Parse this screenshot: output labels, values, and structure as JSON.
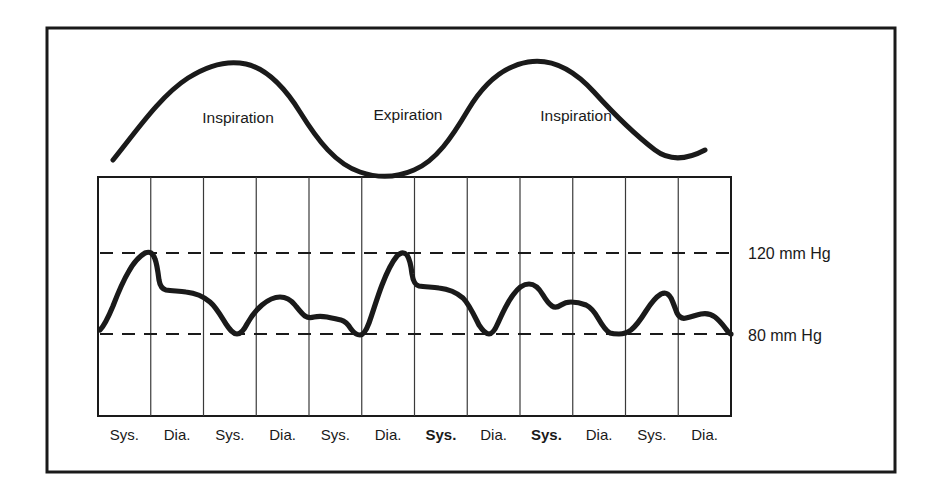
{
  "figure": {
    "name": "pulsus-paradoxus-diagram",
    "background_color": "#ffffff",
    "ink_color": "#1a1a1a",
    "frame": {
      "x": 47,
      "y": 28,
      "width": 848,
      "height": 444,
      "stroke_width": 3
    }
  },
  "respiration": {
    "curve_name": "respiration-trace",
    "labels": [
      {
        "text": "Inspiration",
        "x": 238,
        "y": 123
      },
      {
        "text": "Expiration",
        "x": 408,
        "y": 120
      },
      {
        "text": "Inspiration",
        "x": 576,
        "y": 121
      }
    ],
    "path": "M 113 160 C 135 133, 160 96, 188 78 C 210 64, 228 60, 246 64 C 268 69, 285 88, 300 112 C 318 141, 336 164, 360 172 C 380 179, 398 177, 414 170 C 436 161, 452 137, 468 110 C 484 83, 504 66, 528 62 C 552 58, 574 70, 594 92 C 614 114, 634 134, 655 150 C 672 163, 690 158, 705 150",
    "stroke_width": 5
  },
  "plot": {
    "name": "blood-pressure-trace",
    "grid": {
      "x": 98,
      "y": 177,
      "width": 633,
      "height": 239,
      "columns": 12,
      "border_stroke": 2,
      "line_stroke": 1.2,
      "line_color": "#3a3a3a"
    },
    "reference_lines": [
      {
        "label": "120 mm Hg",
        "y": 253,
        "label_x": 748,
        "label_y": 259
      },
      {
        "label": "80 mm Hg",
        "y": 334,
        "label_x": 748,
        "label_y": 341
      }
    ],
    "waveform_path": "M 100 330 C 104 326, 108 318, 113 306 C 118 293, 123 281, 129 271 C 134 262, 140 256, 145 253 C 150 251, 153 253, 155 259 C 157 264, 158 272, 159 280 C 160 286, 162 289, 166 290 C 172 291, 179 291, 186 292 C 195 293, 203 296, 210 302 C 216 307, 221 316, 226 324 C 230 330, 233 334, 237 334 C 241 334, 244 330, 247 324 C 251 317, 256 310, 262 305 C 268 300, 274 297, 280 297 C 286 297, 291 300, 295 305 C 299 310, 302 314, 305 316 C 308 318, 311 318, 314 317 C 318 316, 322 316, 327 317 C 332 318, 337 319, 341 320 C 345 321, 348 324, 351 329 C 354 333, 357 335, 360 335 C 363 335, 366 331, 369 323 C 373 312, 377 298, 382 285 C 387 272, 392 262, 397 256 C 401 252, 404 252, 407 255 C 409 258, 411 265, 412 274 C 413 281, 415 285, 419 286 C 425 287, 432 287, 439 288 C 448 289, 456 292, 463 298 C 469 304, 474 315, 479 325 C 483 331, 486 334, 489 334 C 492 334, 495 330, 498 323 C 502 314, 507 303, 513 295 C 518 288, 524 284, 529 284 C 534 284, 539 288, 543 295 C 546 300, 549 304, 552 306 C 555 308, 558 307, 561 305 C 564 303, 567 302, 571 302 C 576 302, 581 303, 586 305 C 590 307, 594 311, 598 318 C 602 325, 606 331, 610 333 C 613 334, 616 334, 619 334 C 623 334, 627 333, 631 330 C 636 326, 641 319, 646 311 C 651 303, 656 297, 661 294 C 665 292, 668 293, 671 298 C 673 302, 675 308, 677 313 C 679 317, 682 319, 686 318 C 691 317, 696 315, 701 314 C 706 313, 711 314, 715 317 C 719 320, 723 325, 726 329 C 728 332, 730 334, 731 334",
    "waveform_stroke": 5.2,
    "beat_labels": [
      {
        "text": "Sys.",
        "bold": false
      },
      {
        "text": "Dia.",
        "bold": false
      },
      {
        "text": "Sys.",
        "bold": false
      },
      {
        "text": "Dia.",
        "bold": false
      },
      {
        "text": "Sys.",
        "bold": false
      },
      {
        "text": "Dia.",
        "bold": false
      },
      {
        "text": "Sys.",
        "bold": true
      },
      {
        "text": "Dia.",
        "bold": false
      },
      {
        "text": "Sys.",
        "bold": true
      },
      {
        "text": "Dia.",
        "bold": false
      },
      {
        "text": "Sys.",
        "bold": false
      },
      {
        "text": "Dia.",
        "bold": false
      }
    ],
    "beat_label_y": 440
  },
  "chart_data": {
    "type": "line",
    "title": "",
    "subtitle": "",
    "xlabel": "",
    "ylabel": "",
    "ylim": [
      60,
      140
    ],
    "grid": true,
    "legend_position": "none",
    "y_reference_lines": [
      {
        "value": 120,
        "label": "120 mm Hg"
      },
      {
        "value": 80,
        "label": "80 mm Hg"
      }
    ],
    "x_tick_labels": [
      "Sys.",
      "Dia.",
      "Sys.",
      "Dia.",
      "Sys.",
      "Dia.",
      "Sys.",
      "Dia.",
      "Sys.",
      "Dia.",
      "Sys.",
      "Dia."
    ],
    "annotations": [
      "Inspiration",
      "Expiration",
      "Inspiration"
    ],
    "series": [
      {
        "name": "Respiration",
        "units": "relative volume",
        "description": "Sinusoidal respiratory trace: inspiration peak, expiration trough, inspiration peak",
        "x": [
          0,
          1,
          2,
          3,
          4,
          5,
          6,
          7,
          8,
          9,
          10,
          11,
          12
        ],
        "values": [
          0.05,
          0.55,
          0.95,
          1.0,
          0.75,
          0.3,
          0.0,
          0.05,
          0.45,
          0.9,
          1.0,
          0.75,
          0.3
        ]
      },
      {
        "name": "Arterial blood pressure",
        "units": "mm Hg",
        "description": "Pulsus paradoxus: systolic pressure falls during inspiration and rises during expiration",
        "beats": [
          {
            "index": 1,
            "phase": "Inspiration",
            "systolic": 120,
            "diastolic": 80
          },
          {
            "index": 2,
            "phase": "Inspiration",
            "systolic": 102,
            "diastolic": 80
          },
          {
            "index": 3,
            "phase": "Inspiration",
            "systolic": 98,
            "diastolic": 80
          },
          {
            "index": 4,
            "phase": "Expiration",
            "systolic": 120,
            "diastolic": 80
          },
          {
            "index": 5,
            "phase": "Expiration",
            "systolic": 113,
            "diastolic": 80
          },
          {
            "index": 6,
            "phase": "Inspiration",
            "systolic": 100,
            "diastolic": 80
          },
          {
            "index": 7,
            "phase": "Inspiration",
            "systolic": 104,
            "diastolic": 80
          },
          {
            "index": 8,
            "phase": "Inspiration",
            "systolic": 96,
            "diastolic": 82
          }
        ]
      }
    ]
  }
}
